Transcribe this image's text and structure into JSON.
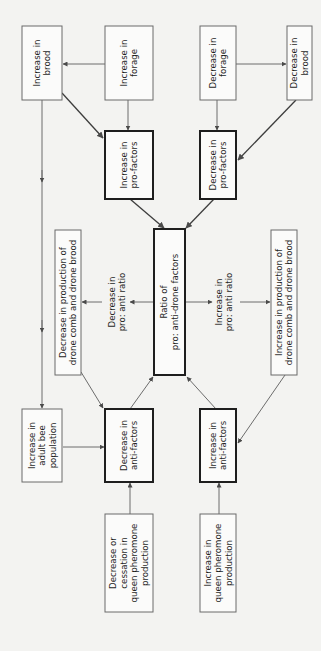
{
  "diagram": {
    "nodes": [
      {
        "id": "inc_brood",
        "lines": [
          "Increase in",
          "brood"
        ],
        "x": 22,
        "y": 26,
        "w": 40,
        "h": 74,
        "thick": false
      },
      {
        "id": "inc_forage",
        "lines": [
          "Increase in",
          "forage"
        ],
        "x": 105,
        "y": 26,
        "w": 48,
        "h": 74,
        "thick": false
      },
      {
        "id": "dec_forage",
        "lines": [
          "Decrease in",
          "forage"
        ],
        "x": 200,
        "y": 26,
        "w": 36,
        "h": 74,
        "thick": false
      },
      {
        "id": "dec_brood",
        "lines": [
          "Decrease in",
          "brood"
        ],
        "x": 287,
        "y": 26,
        "w": 25,
        "h": 74,
        "thick": false
      },
      {
        "id": "inc_pro",
        "lines": [
          "Increase in",
          "pro-factors"
        ],
        "x": 105,
        "y": 131,
        "w": 48,
        "h": 68,
        "thick": true
      },
      {
        "id": "dec_pro",
        "lines": [
          "Decrease in",
          "pro-factors"
        ],
        "x": 200,
        "y": 131,
        "w": 36,
        "h": 68,
        "thick": true
      },
      {
        "id": "ratio",
        "lines": [
          "Ratio of",
          "pro: anti-drone factors"
        ],
        "x": 154,
        "y": 229,
        "w": 31,
        "h": 146,
        "thick": true
      },
      {
        "id": "dec_prod",
        "lines": [
          "Decrease in production of",
          "drone comb and drone brood"
        ],
        "x": 55,
        "y": 230,
        "w": 26,
        "h": 145,
        "thick": false
      },
      {
        "id": "inc_prod",
        "lines": [
          "Increase in production of",
          "drone comb and drone brood"
        ],
        "x": 271,
        "y": 230,
        "w": 26,
        "h": 145,
        "thick": false
      },
      {
        "id": "inc_adult",
        "lines": [
          "Increase in",
          "adult bee",
          "population"
        ],
        "x": 22,
        "y": 409,
        "w": 40,
        "h": 73,
        "thick": false
      },
      {
        "id": "dec_anti",
        "lines": [
          "Decrease in",
          "anti-factors"
        ],
        "x": 105,
        "y": 409,
        "w": 48,
        "h": 73,
        "thick": true
      },
      {
        "id": "inc_anti",
        "lines": [
          "Increase in",
          "anti-factors"
        ],
        "x": 200,
        "y": 409,
        "w": 36,
        "h": 73,
        "thick": true
      },
      {
        "id": "dec_queen",
        "lines": [
          "Decrease or",
          "cessation in",
          "queen pheromone",
          "production"
        ],
        "x": 105,
        "y": 514,
        "w": 48,
        "h": 98,
        "thick": false
      },
      {
        "id": "inc_queen",
        "lines": [
          "Increase in",
          "queen pheromone",
          "production"
        ],
        "x": 200,
        "y": 514,
        "w": 36,
        "h": 98,
        "thick": false
      }
    ],
    "edge_labels": [
      {
        "id": "dec_ratio_label",
        "lines": [
          "Decrease in",
          "pro: anti ratio"
        ],
        "cx": 117,
        "cy": 302
      },
      {
        "id": "inc_ratio_label",
        "lines": [
          "Increase in",
          "pro: anti ratio"
        ],
        "cx": 224,
        "cy": 302
      }
    ],
    "edges": [
      {
        "from": "inc_forage",
        "to": "inc_brood",
        "d": "M105,64 L63,64",
        "dark": false
      },
      {
        "from": "dec_forage",
        "to": "dec_brood",
        "d": "M236,64 L286,64",
        "dark": false
      },
      {
        "from": "inc_forage",
        "to": "inc_pro",
        "d": "M128,100 L128,130",
        "dark": false
      },
      {
        "from": "dec_forage",
        "to": "dec_pro",
        "d": "M217,100 L217,130",
        "dark": false
      },
      {
        "from": "inc_brood",
        "to": "inc_pro",
        "d": "M62,93 L103,138",
        "dark": true
      },
      {
        "from": "dec_brood",
        "to": "dec_pro",
        "d": "M296,100 L238,160",
        "dark": true
      },
      {
        "from": "inc_brood",
        "to": "inc_adult",
        "d": "M42,100 L42,408",
        "dark": false
      },
      {
        "from": "inc_pro",
        "to": "ratio",
        "d": "M130,199 L164,228",
        "dark": true
      },
      {
        "from": "dec_pro",
        "to": "ratio",
        "d": "M214,199 L186,228",
        "dark": true
      },
      {
        "from": "ratio",
        "to": "dec_ratio_label",
        "d": "M153,302 L130,302",
        "dark": false
      },
      {
        "from": "dec_ratio_label",
        "to": "dec_prod",
        "d": "M102,302 L82,302",
        "dark": false
      },
      {
        "from": "ratio",
        "to": "inc_ratio_label",
        "d": "M185,302 L212,302",
        "dark": false
      },
      {
        "from": "inc_ratio_label",
        "to": "inc_prod",
        "d": "M240,302 L270,302",
        "dark": false
      },
      {
        "from": "dec_prod",
        "to": "dec_anti",
        "d": "M81,372 L103,408",
        "dark": false
      },
      {
        "from": "inc_prod",
        "to": "inc_anti",
        "d": "M285,375 L238,443",
        "dark": false
      },
      {
        "from": "dec_anti",
        "to": "ratio",
        "d": "M130,409 L153,377",
        "dark": false
      },
      {
        "from": "inc_anti",
        "to": "ratio",
        "d": "M216,409 L187,377",
        "dark": false
      },
      {
        "from": "inc_adult",
        "to": "dec_anti",
        "d": "M63,447 L104,447",
        "dark": false
      },
      {
        "from": "dec_queen",
        "to": "dec_anti",
        "d": "M130,514 L130,483",
        "dark": false
      },
      {
        "from": "inc_queen",
        "to": "inc_anti",
        "d": "M219,514 L219,483",
        "dark": false
      }
    ]
  },
  "colors": {
    "background": "#f3f3f1",
    "box_fill": "#fbfbfa",
    "thick_border": "#1e1e1e",
    "thin_border": "#6a6a6a",
    "arrow": "#6c6c6c",
    "text": "#1f1f1f"
  }
}
